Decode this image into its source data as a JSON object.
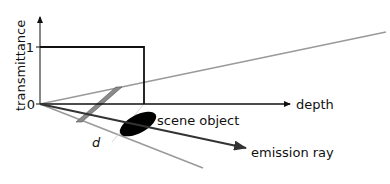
{
  "diagram": {
    "y_axis_label": "transmittance",
    "y_tick_one": "1",
    "y_tick_zero": "0",
    "x_axis_label": "depth",
    "object_label": "scene object",
    "ray_label": "emission ray",
    "distance_label": "d"
  },
  "colors": {
    "axis": "#111111",
    "frustum": "#999999",
    "ray": "#333333",
    "band": "#8a8a8a",
    "object": "#000000"
  }
}
